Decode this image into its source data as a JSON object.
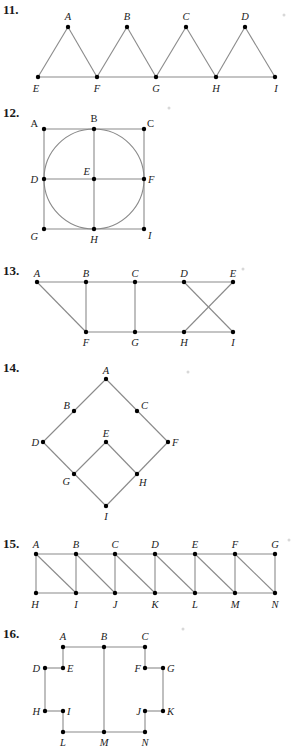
{
  "figures": [
    {
      "number": "11.",
      "label_pos": [
        3,
        14
      ],
      "vertices": {
        "A": [
          68,
          27
        ],
        "B": [
          127,
          27
        ],
        "C": [
          186,
          27
        ],
        "D": [
          245,
          27
        ],
        "E": [
          38,
          77
        ],
        "F": [
          97,
          77
        ],
        "G": [
          156,
          77
        ],
        "H": [
          216,
          77
        ],
        "I": [
          275,
          77
        ]
      },
      "labels": {
        "A": [
          68,
          20,
          "middle"
        ],
        "B": [
          127,
          20,
          "middle"
        ],
        "C": [
          186,
          20,
          "middle"
        ],
        "D": [
          245,
          20,
          "middle"
        ],
        "E": [
          36,
          92,
          "middle"
        ],
        "F": [
          97,
          92,
          "middle"
        ],
        "G": [
          156,
          92,
          "middle"
        ],
        "H": [
          216,
          92,
          "middle"
        ],
        "I": [
          276,
          92,
          "middle"
        ]
      },
      "edges": [
        [
          "E",
          "A"
        ],
        [
          "A",
          "F"
        ],
        [
          "F",
          "B"
        ],
        [
          "B",
          "G"
        ],
        [
          "G",
          "C"
        ],
        [
          "C",
          "H"
        ],
        [
          "H",
          "D"
        ],
        [
          "D",
          "I"
        ],
        [
          "E",
          "F"
        ],
        [
          "F",
          "G"
        ],
        [
          "G",
          "H"
        ],
        [
          "H",
          "I"
        ]
      ],
      "circles": []
    },
    {
      "number": "12.",
      "label_pos": [
        3,
        117
      ],
      "vertices": {
        "A": [
          44,
          129
        ],
        "B": [
          94,
          129
        ],
        "C": [
          144,
          129
        ],
        "D": [
          44,
          179
        ],
        "E": [
          94,
          179
        ],
        "F": [
          144,
          179
        ],
        "G": [
          44,
          229
        ],
        "H": [
          94,
          229
        ],
        "I": [
          144,
          229
        ]
      },
      "labels": {
        "A": [
          38,
          127,
          "end",
          "upright"
        ],
        "B": [
          94,
          122,
          "middle",
          "upright"
        ],
        "C": [
          147,
          127,
          "start",
          "upright"
        ],
        "D": [
          38,
          183,
          "end"
        ],
        "E": [
          90,
          175,
          "end"
        ],
        "F": [
          148,
          183,
          "start"
        ],
        "G": [
          38,
          240,
          "end"
        ],
        "H": [
          94,
          243,
          "middle"
        ],
        "I": [
          148,
          239,
          "start"
        ]
      },
      "edges": [
        [
          "A",
          "C"
        ],
        [
          "C",
          "I"
        ],
        [
          "I",
          "G"
        ],
        [
          "G",
          "A"
        ],
        [
          "B",
          "H"
        ],
        [
          "D",
          "F"
        ]
      ],
      "circles": [
        [
          94,
          179,
          50
        ]
      ]
    },
    {
      "number": "13.",
      "label_pos": [
        3,
        275
      ],
      "vertices": {
        "A": [
          37,
          282
        ],
        "B": [
          86,
          282
        ],
        "C": [
          135,
          282
        ],
        "D": [
          184,
          282
        ],
        "E": [
          233,
          282
        ],
        "F": [
          86,
          332
        ],
        "G": [
          135,
          332
        ],
        "H": [
          184,
          332
        ],
        "I": [
          233,
          332
        ]
      },
      "labels": {
        "A": [
          37,
          277,
          "middle"
        ],
        "B": [
          86,
          277,
          "middle"
        ],
        "C": [
          135,
          277,
          "middle"
        ],
        "D": [
          184,
          277,
          "middle"
        ],
        "E": [
          233,
          277,
          "middle"
        ],
        "F": [
          86,
          346,
          "middle"
        ],
        "G": [
          135,
          346,
          "middle"
        ],
        "H": [
          184,
          346,
          "middle"
        ],
        "I": [
          233,
          346,
          "middle"
        ]
      },
      "edges": [
        [
          "A",
          "E"
        ],
        [
          "F",
          "I"
        ],
        [
          "A",
          "F"
        ],
        [
          "B",
          "F"
        ],
        [
          "C",
          "G"
        ],
        [
          "D",
          "I"
        ],
        [
          "E",
          "H"
        ]
      ],
      "circles": []
    },
    {
      "number": "14.",
      "label_pos": [
        3,
        372
      ],
      "vertices": {
        "A": [
          106,
          379
        ],
        "B": [
          74,
          411
        ],
        "C": [
          137,
          411
        ],
        "D": [
          43,
          442
        ],
        "E": [
          106,
          442
        ],
        "F": [
          168,
          442
        ],
        "G": [
          74,
          474
        ],
        "H": [
          137,
          474
        ],
        "I": [
          106,
          506
        ]
      },
      "labels": {
        "A": [
          106,
          374,
          "middle"
        ],
        "B": [
          70,
          409,
          "end"
        ],
        "C": [
          141,
          409,
          "start"
        ],
        "D": [
          39,
          446,
          "end"
        ],
        "E": [
          106,
          437,
          "middle"
        ],
        "F": [
          172,
          446,
          "start"
        ],
        "G": [
          70,
          485,
          "end"
        ],
        "H": [
          139,
          486,
          "start"
        ],
        "I": [
          106,
          520,
          "middle"
        ]
      },
      "edges": [
        [
          "A",
          "D"
        ],
        [
          "A",
          "F"
        ],
        [
          "D",
          "I"
        ],
        [
          "F",
          "I"
        ],
        [
          "E",
          "G"
        ],
        [
          "E",
          "H"
        ]
      ],
      "circles": []
    },
    {
      "number": "15.",
      "label_pos": [
        3,
        548
      ],
      "vertices": {
        "A": [
          36,
          554
        ],
        "B": [
          76,
          554
        ],
        "C": [
          115,
          554
        ],
        "D": [
          155,
          554
        ],
        "E": [
          195,
          554
        ],
        "F": [
          235,
          554
        ],
        "G": [
          275,
          554
        ],
        "H": [
          36,
          593
        ],
        "I": [
          76,
          593
        ],
        "J": [
          115,
          593
        ],
        "K": [
          155,
          593
        ],
        "L": [
          195,
          593
        ],
        "M": [
          235,
          593
        ],
        "N": [
          275,
          593
        ]
      },
      "labels": {
        "A": [
          36,
          548,
          "middle"
        ],
        "B": [
          76,
          548,
          "middle"
        ],
        "C": [
          115,
          548,
          "middle"
        ],
        "D": [
          155,
          548,
          "middle"
        ],
        "E": [
          195,
          548,
          "middle"
        ],
        "F": [
          235,
          548,
          "middle"
        ],
        "G": [
          275,
          548,
          "middle"
        ],
        "H": [
          35,
          608,
          "middle"
        ],
        "I": [
          76,
          608,
          "middle"
        ],
        "J": [
          115,
          608,
          "middle"
        ],
        "K": [
          155,
          608,
          "middle"
        ],
        "L": [
          195,
          608,
          "middle"
        ],
        "M": [
          235,
          608,
          "middle"
        ],
        "N": [
          275,
          608,
          "middle"
        ]
      },
      "edges": [
        [
          "A",
          "G"
        ],
        [
          "H",
          "N"
        ],
        [
          "A",
          "H"
        ],
        [
          "B",
          "I"
        ],
        [
          "C",
          "J"
        ],
        [
          "D",
          "K"
        ],
        [
          "E",
          "L"
        ],
        [
          "F",
          "M"
        ],
        [
          "G",
          "N"
        ],
        [
          "A",
          "I"
        ],
        [
          "B",
          "J"
        ],
        [
          "C",
          "K"
        ],
        [
          "D",
          "L"
        ],
        [
          "E",
          "M"
        ],
        [
          "F",
          "N"
        ]
      ],
      "circles": []
    },
    {
      "number": "16.",
      "label_pos": [
        3,
        638
      ],
      "vertices": {
        "A": [
          63,
          647
        ],
        "B": [
          104,
          647
        ],
        "C": [
          145,
          647
        ],
        "D": [
          45,
          668
        ],
        "E": [
          63,
          668
        ],
        "F": [
          145,
          668
        ],
        "G": [
          163,
          668
        ],
        "H": [
          45,
          711
        ],
        "I": [
          63,
          711
        ],
        "J": [
          145,
          711
        ],
        "K": [
          163,
          711
        ],
        "L": [
          63,
          732
        ],
        "M": [
          104,
          732
        ],
        "N": [
          145,
          732
        ]
      },
      "labels": {
        "A": [
          63,
          640,
          "middle"
        ],
        "B": [
          104,
          640,
          "middle"
        ],
        "C": [
          145,
          640,
          "middle"
        ],
        "D": [
          40,
          672,
          "end"
        ],
        "E": [
          67,
          672,
          "start"
        ],
        "F": [
          141,
          672,
          "end"
        ],
        "G": [
          167,
          672,
          "start"
        ],
        "H": [
          40,
          715,
          "end"
        ],
        "I": [
          67,
          715,
          "start"
        ],
        "J": [
          141,
          715,
          "end"
        ],
        "K": [
          167,
          715,
          "start"
        ],
        "L": [
          63,
          746,
          "middle"
        ],
        "M": [
          104,
          746,
          "middle"
        ],
        "N": [
          145,
          746,
          "middle"
        ]
      },
      "edges": [
        [
          "A",
          "C"
        ],
        [
          "A",
          "E"
        ],
        [
          "E",
          "D"
        ],
        [
          "D",
          "H"
        ],
        [
          "H",
          "I"
        ],
        [
          "I",
          "L"
        ],
        [
          "L",
          "N"
        ],
        [
          "N",
          "J"
        ],
        [
          "J",
          "K"
        ],
        [
          "K",
          "G"
        ],
        [
          "G",
          "F"
        ],
        [
          "F",
          "C"
        ],
        [
          "B",
          "M"
        ]
      ],
      "circles": []
    }
  ],
  "specks": [
    [
      284,
      15
    ],
    [
      169,
      108
    ],
    [
      243,
      269
    ],
    [
      188,
      372
    ],
    [
      289,
      540
    ],
    [
      183,
      629
    ]
  ]
}
